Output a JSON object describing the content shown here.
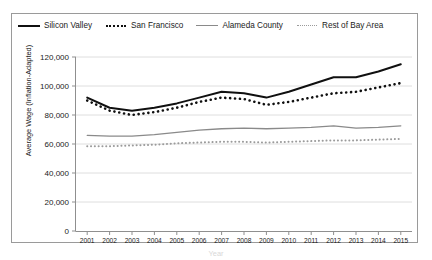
{
  "chart_data": {
    "type": "line",
    "title": "",
    "xlabel": "Year",
    "ylabel": "Average Wage (Inflation-Adapted)",
    "ylim": [
      0,
      120000
    ],
    "yticks": [
      0,
      20000,
      40000,
      60000,
      80000,
      100000,
      120000
    ],
    "ytick_labels": [
      "0",
      "20,000",
      "40,000",
      "60,000",
      "80,000",
      "100,000",
      "120,000"
    ],
    "grid": true,
    "legend_position": "top",
    "categories": [
      2001,
      2002,
      2003,
      2004,
      2005,
      2006,
      2007,
      2008,
      2009,
      2010,
      2011,
      2012,
      2013,
      2014,
      2015
    ],
    "xtick_labels": [
      "2001",
      "2002",
      "2003",
      "2004",
      "2005",
      "2006",
      "2007",
      "2008",
      "2009",
      "2010",
      "2011",
      "2012",
      "2013",
      "2014",
      "2015"
    ],
    "series": [
      {
        "name": "Silicon Valley",
        "style": "solid",
        "color": "#101010",
        "values": [
          92000,
          85000,
          83000,
          85000,
          88000,
          92000,
          96000,
          95000,
          92000,
          96000,
          101000,
          106000,
          106000,
          110000,
          115000
        ]
      },
      {
        "name": "San Francisco",
        "style": "dotted",
        "color": "#101010",
        "values": [
          90000,
          83000,
          80000,
          82000,
          85000,
          89000,
          92000,
          91000,
          87000,
          89000,
          92000,
          95000,
          96000,
          99000,
          102000
        ]
      },
      {
        "name": "Alameda County",
        "style": "solid",
        "color": "#8a8a8a",
        "values": [
          66000,
          65500,
          65500,
          66500,
          68000,
          69500,
          70500,
          71000,
          70500,
          71000,
          71500,
          72500,
          71000,
          71500,
          72500
        ]
      },
      {
        "name": "Rest of Bay Area",
        "style": "dotted",
        "color": "#9b9b9b",
        "values": [
          58500,
          58500,
          59000,
          59500,
          60500,
          61000,
          61500,
          61500,
          61000,
          61500,
          62000,
          62500,
          62500,
          63000,
          63500
        ]
      }
    ]
  },
  "legend": {
    "entries": [
      {
        "label": "Silicon Valley"
      },
      {
        "label": "San Francisco"
      },
      {
        "label": "Alameda County"
      },
      {
        "label": "Rest of Bay Area"
      }
    ]
  }
}
